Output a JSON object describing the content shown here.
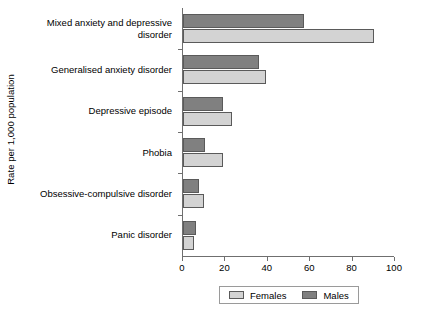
{
  "chart_data": {
    "type": "bar",
    "orientation": "horizontal",
    "title": "",
    "xlabel": "",
    "ylabel": "Rate per 1,000 population",
    "xlim": [
      0,
      100
    ],
    "xticks": [
      0,
      20,
      40,
      60,
      80,
      100
    ],
    "xtick_labels": [
      "0",
      "20",
      "40",
      "60",
      "80",
      "100"
    ],
    "grid": false,
    "legend_position": "bottom",
    "categories": [
      "Mixed anxiety and depressive disorder",
      "Generalised anxiety disorder",
      "Depressive episode",
      "Phobia",
      "Obsessive-compulsive disorder",
      "Panic disorder"
    ],
    "category_lines": [
      [
        "Mixed anxiety and depressive",
        "disorder"
      ],
      [
        "Generalised anxiety disorder"
      ],
      [
        "Depressive episode"
      ],
      [
        "Phobia"
      ],
      [
        "Obsessive-compulsive disorder"
      ],
      [
        "Panic disorder"
      ]
    ],
    "series": [
      {
        "name": "Females",
        "color": "#d3d3d3",
        "values": [
          90,
          39,
          23,
          19,
          10,
          5
        ]
      },
      {
        "name": "Males",
        "color": "#808080",
        "values": [
          57,
          36,
          19,
          10.5,
          7.5,
          6
        ]
      }
    ]
  },
  "legend": {
    "entries": [
      {
        "label": "Females",
        "color": "#d3d3d3"
      },
      {
        "label": "Males",
        "color": "#808080"
      }
    ]
  },
  "colors": {
    "females": "#d3d3d3",
    "males": "#808080",
    "bar_border": "#5a5a5a",
    "axis": "#6f6f6f",
    "text": "#000000",
    "background": "#ffffff"
  }
}
